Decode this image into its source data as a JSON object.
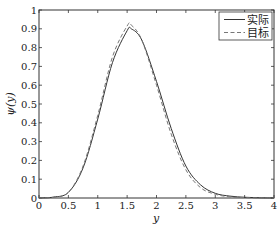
{
  "chart_data": {
    "type": "line",
    "title": "",
    "xlabel": "y",
    "ylabel": "ψ(y)",
    "xlim": [
      0,
      4
    ],
    "ylim": [
      0,
      1
    ],
    "grid": false,
    "legend_position": "upper right",
    "xticks": [
      0,
      0.5,
      1,
      1.5,
      2,
      2.5,
      3,
      3.5,
      4
    ],
    "xtick_labels": [
      "0",
      "0.5",
      "1",
      "1.5",
      "2",
      "2.5",
      "3",
      "3.5",
      "4"
    ],
    "yticks": [
      0,
      0.1,
      0.2,
      0.3,
      0.4,
      0.5,
      0.6,
      0.7,
      0.8,
      0.9,
      1
    ],
    "ytick_labels": [
      "0",
      "0.1",
      "0.2",
      "0.3",
      "0.4",
      "0.5",
      "0.6",
      "0.7",
      "0.8",
      "0.9",
      "1"
    ],
    "x": [
      0,
      0.25,
      0.5,
      0.75,
      1.0,
      1.25,
      1.5,
      1.57,
      1.75,
      2.0,
      2.25,
      2.5,
      2.75,
      3.0,
      3.25,
      3.5,
      3.75,
      4.0
    ],
    "series": [
      {
        "name": "实际",
        "style": "solid",
        "color": "#333333",
        "values": [
          0.0,
          0.005,
          0.03,
          0.16,
          0.42,
          0.72,
          0.89,
          0.9,
          0.84,
          0.62,
          0.37,
          0.17,
          0.07,
          0.025,
          0.01,
          0.004,
          0.001,
          0.0
        ]
      },
      {
        "name": "目标",
        "style": "dashed",
        "color": "#777777",
        "values": [
          0.0,
          0.004,
          0.03,
          0.17,
          0.44,
          0.75,
          0.915,
          0.92,
          0.84,
          0.6,
          0.34,
          0.15,
          0.055,
          0.02,
          0.006,
          0.002,
          0.0,
          0.0
        ]
      }
    ]
  },
  "legend": {
    "items": [
      {
        "label": "实际",
        "style": "solid"
      },
      {
        "label": "目标",
        "style": "dashed"
      }
    ]
  },
  "axes": {
    "xlabel": "y",
    "ylabel": "ψ(y)"
  }
}
